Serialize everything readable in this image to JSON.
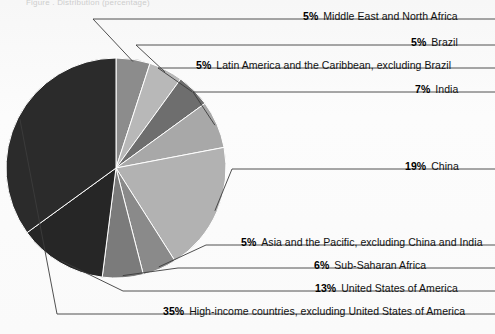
{
  "figure": {
    "truncated_top_text": "Figure  .  Distribution (percentage)",
    "background_color": "#fbfbfb",
    "leader_line_color": "#3c3c3c"
  },
  "chart_data": {
    "type": "pie",
    "title": "",
    "subtitle": "",
    "xlabel": "",
    "ylabel": "",
    "grid": false,
    "legend_position": "callout-labels",
    "units": "percent",
    "start_angle_deg": 0,
    "direction": "clockwise",
    "total": 100,
    "categories": [
      "Middle East and North Africa",
      "Brazil",
      "Latin America and the Caribbean, excluding Brazil",
      "India",
      "China",
      "Asia and the Pacific, excluding China and India",
      "Sub-Saharan Africa",
      "United States of America",
      "High-income countries, excluding United States of America"
    ],
    "values": [
      5,
      5,
      5,
      7,
      19,
      5,
      6,
      13,
      35
    ],
    "colors": [
      "#8c8c8c",
      "#b8b8b8",
      "#6e6e6e",
      "#a8a8a8",
      "#b2b2b2",
      "#8a8a8a",
      "#7b7b7b",
      "#262626",
      "#2b2b2b"
    ],
    "slices": [
      {
        "label": "Middle East and North Africa",
        "value": 5,
        "display": "5%",
        "color": "#8c8c8c"
      },
      {
        "label": "Brazil",
        "value": 5,
        "display": "5%",
        "color": "#b8b8b8"
      },
      {
        "label": "Latin America and the Caribbean, excluding Brazil",
        "value": 5,
        "display": "5%",
        "color": "#6e6e6e"
      },
      {
        "label": "India",
        "value": 7,
        "display": "7%",
        "color": "#a8a8a8"
      },
      {
        "label": "China",
        "value": 19,
        "display": "19%",
        "color": "#b2b2b2"
      },
      {
        "label": "Asia and the Pacific, excluding China and India",
        "value": 5,
        "display": "5%",
        "color": "#8a8a8a"
      },
      {
        "label": "Sub-Saharan Africa",
        "value": 6,
        "display": "6%",
        "color": "#7b7b7b"
      },
      {
        "label": "United States of America",
        "value": 13,
        "display": "13%",
        "color": "#262626"
      },
      {
        "label": "High-income countries, excluding United States of America",
        "value": 35,
        "display": "35%",
        "color": "#2b2b2b"
      }
    ]
  },
  "labels": [
    {
      "pct": "5%",
      "name": "Middle East and North Africa"
    },
    {
      "pct": "5%",
      "name": "Brazil"
    },
    {
      "pct": "5%",
      "name": "Latin America and the Caribbean, excluding Brazil"
    },
    {
      "pct": "7%",
      "name": "India"
    },
    {
      "pct": "19%",
      "name": "China"
    },
    {
      "pct": "5%",
      "name": "Asia and the Pacific, excluding China and India"
    },
    {
      "pct": "6%",
      "name": "Sub-Saharan Africa"
    },
    {
      "pct": "13%",
      "name": "United States of America"
    },
    {
      "pct": "35%",
      "name": "High-income countries, excluding United States of America"
    }
  ]
}
